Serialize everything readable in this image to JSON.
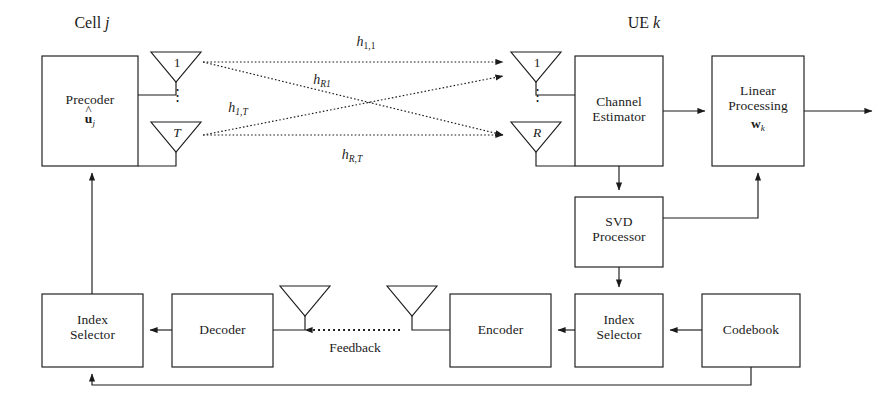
{
  "figure": {
    "type": "block-diagram",
    "domain": "wireless-communications",
    "sections": {
      "transmitter_title": "Cell j",
      "receiver_title": "UE k"
    },
    "blocks": {
      "precoder": {
        "line1": "Precoder",
        "line2_symbol": "u",
        "line2_sub": "j",
        "line2_hat": "^",
        "name": "Precoder û_j"
      },
      "channel_estimator": {
        "line1": "Channel",
        "line2": "Estimator"
      },
      "linear_processing": {
        "line1": "Linear",
        "line2": "Processing",
        "line3_symbol": "w",
        "line3_sub": "k"
      },
      "svd_processor": {
        "line1": "SVD",
        "line2": "Processor"
      },
      "index_selector_ue": {
        "line1": "Index",
        "line2": "Selector"
      },
      "codebook": {
        "line1": "Codebook"
      },
      "encoder": {
        "line1": "Encoder"
      },
      "decoder": {
        "line1": "Decoder"
      },
      "index_selector_bs": {
        "line1": "Index",
        "line2": "Selector"
      }
    },
    "antennas": {
      "tx_first": "1",
      "tx_last": "T",
      "rx_first": "1",
      "rx_last": "R",
      "ellipsis": "⋮"
    },
    "channel_labels": [
      {
        "id": "h11",
        "base": "h",
        "sub": "1,1"
      },
      {
        "id": "hR1",
        "base": "h",
        "sub": "R1"
      },
      {
        "id": "h1T",
        "base": "h",
        "sub": "1,T"
      },
      {
        "id": "hRT",
        "base": "h",
        "sub": "R,T"
      }
    ],
    "feedback_label": "Feedback",
    "colors": {
      "stroke": "#1b1b1b",
      "background": "#ffffff",
      "text": "#1b1b1b"
    }
  }
}
